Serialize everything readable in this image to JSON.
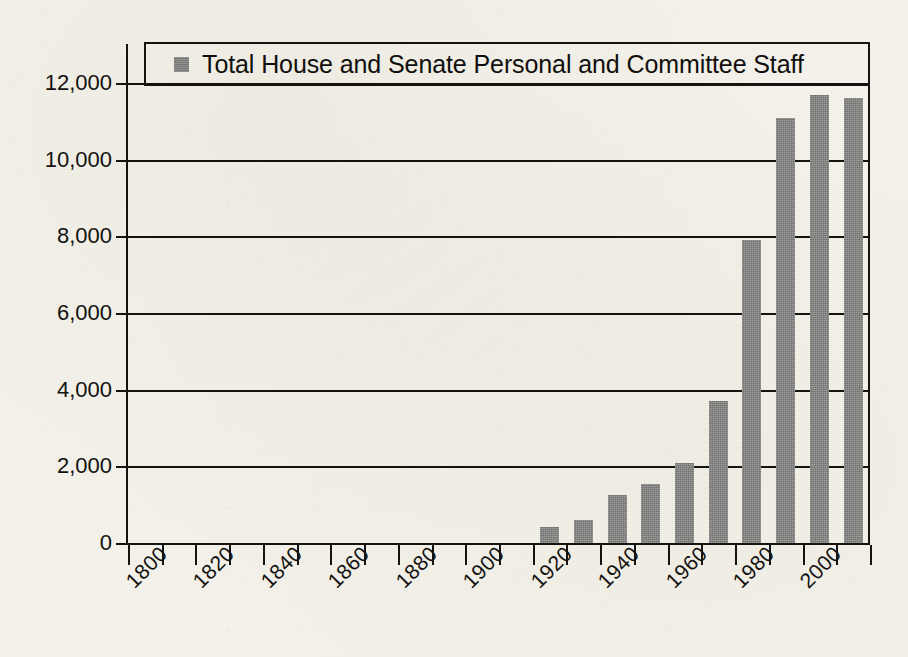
{
  "chart_data": {
    "type": "bar",
    "title": "",
    "subtitle": "",
    "xlabel": "",
    "ylabel": "",
    "grid": true,
    "legend_position": "top",
    "legend": [
      "Total House and Senate Personal and Committee Staff"
    ],
    "series_name": "Total House and Senate Personal and Committee Staff",
    "bar_color": "#7b7b79",
    "axis_color": "#14130f",
    "background_color": "#f3f1e9",
    "xlim": [
      1795,
      2015
    ],
    "ylim": [
      0,
      12000
    ],
    "ytick_labels": [
      "12,000",
      "10,000",
      "8,000",
      "6,000",
      "4,000",
      "2,000",
      "0"
    ],
    "ytick_values": [
      12000,
      10000,
      8000,
      6000,
      4000,
      2000,
      0
    ],
    "xtick_labels": [
      "1800",
      "1820",
      "1840",
      "1860",
      "1880",
      "1900",
      "1920",
      "1940",
      "1960",
      "1980",
      "2000"
    ],
    "xtick_values": [
      1800,
      1820,
      1840,
      1860,
      1880,
      1900,
      1920,
      1940,
      1960,
      1980,
      2000
    ],
    "minor_xtick_values": [
      1800,
      1810,
      1820,
      1830,
      1840,
      1850,
      1860,
      1870,
      1880,
      1890,
      1900,
      1910,
      1920,
      1930,
      1940,
      1950,
      1960,
      1970,
      1980,
      1990,
      2000,
      2010
    ],
    "categories": [
      1800,
      1810,
      1820,
      1830,
      1840,
      1850,
      1860,
      1870,
      1880,
      1890,
      1900,
      1910,
      1920,
      1930,
      1940,
      1950,
      1960,
      1970,
      1980,
      1990,
      2000,
      2010
    ],
    "values": [
      0,
      0,
      0,
      0,
      0,
      0,
      0,
      0,
      0,
      0,
      0,
      0,
      425,
      600,
      1250,
      1550,
      2100,
      3700,
      7900,
      11100,
      11700,
      11600
    ]
  }
}
